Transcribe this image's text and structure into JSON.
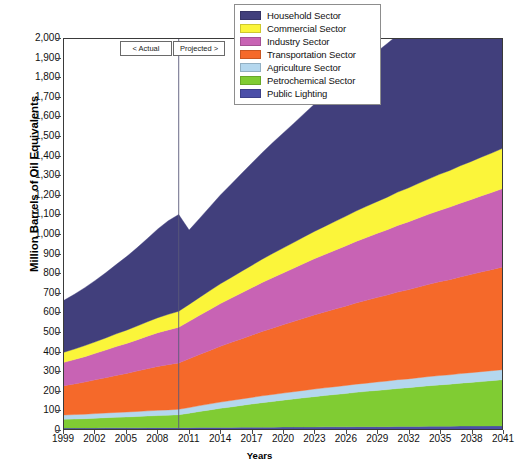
{
  "chart_data": {
    "type": "area",
    "stacked": true,
    "title": "",
    "xlabel": "Years",
    "ylabel": "Million Barrels of Oil Equivalents",
    "xlim": [
      1999,
      2041
    ],
    "ylim": [
      0,
      2000
    ],
    "ytick_step": 100,
    "xtick_step": 3,
    "grid": false,
    "legend_position": "top-right",
    "y_ticks": [
      "0",
      "100",
      "200",
      "300",
      "400",
      "500",
      "600",
      "700",
      "800",
      "900",
      "1,000",
      "1,100",
      "1,200",
      "1,300",
      "1,400",
      "1,500",
      "1,600",
      "1,700",
      "1,800",
      "1,900",
      "2,000"
    ],
    "x_ticks": [
      "1999",
      "2002",
      "2005",
      "2008",
      "2011",
      "2014",
      "2017",
      "2020",
      "2023",
      "2026",
      "2029",
      "2032",
      "2035",
      "2038",
      "2041"
    ],
    "x": [
      1999,
      2000,
      2001,
      2002,
      2003,
      2004,
      2005,
      2006,
      2007,
      2008,
      2009,
      2010,
      2011,
      2012,
      2013,
      2014,
      2015,
      2016,
      2017,
      2018,
      2019,
      2020,
      2021,
      2022,
      2023,
      2024,
      2025,
      2026,
      2027,
      2028,
      2029,
      2030,
      2031,
      2032,
      2033,
      2034,
      2035,
      2036,
      2037,
      2038,
      2039,
      2040,
      2041
    ],
    "annotations": [
      {
        "name": "actual-label",
        "text": "< Actual",
        "x": 2010
      },
      {
        "name": "projected-label",
        "text": "Projected >",
        "x": 2010
      },
      {
        "name": "divider-line",
        "x": 2010
      }
    ],
    "colors": {
      "household": "#413f7c",
      "commercial": "#fbf53a",
      "industry": "#c863b4",
      "transportation": "#f5692a",
      "agriculture": "#b4d7ee",
      "petrochemical": "#80cc33",
      "public_lighting": "#4b4fa8"
    },
    "series": [
      {
        "name": "Public Lighting",
        "key": "public_lighting",
        "color": "#4b4fa8",
        "values": [
          5,
          5,
          5,
          5,
          6,
          6,
          6,
          6,
          7,
          7,
          7,
          7,
          7,
          8,
          8,
          8,
          8,
          9,
          9,
          9,
          9,
          10,
          10,
          10,
          10,
          11,
          11,
          11,
          12,
          12,
          12,
          12,
          13,
          13,
          13,
          14,
          14,
          14,
          15,
          15,
          15,
          16,
          16
        ]
      },
      {
        "name": "Petrochemical Sector",
        "key": "petrochemical",
        "color": "#80cc33",
        "values": [
          45,
          46,
          48,
          50,
          52,
          54,
          56,
          58,
          60,
          62,
          64,
          66,
          74,
          82,
          90,
          98,
          105,
          112,
          119,
          126,
          132,
          138,
          144,
          150,
          156,
          161,
          166,
          171,
          176,
          181,
          186,
          190,
          195,
          199,
          204,
          208,
          212,
          216,
          220,
          224,
          228,
          232,
          236
        ]
      },
      {
        "name": "Agriculture Sector",
        "key": "agriculture",
        "color": "#b4d7ee",
        "values": [
          22,
          23,
          23,
          24,
          24,
          25,
          25,
          26,
          26,
          27,
          27,
          28,
          29,
          30,
          31,
          32,
          33,
          33,
          34,
          35,
          36,
          36,
          37,
          38,
          39,
          39,
          40,
          41,
          42,
          42,
          43,
          44,
          45,
          45,
          46,
          47,
          48,
          48,
          49,
          50,
          51,
          51,
          52
        ]
      },
      {
        "name": "Transportation Sector",
        "key": "transportation",
        "color": "#f5692a",
        "values": [
          150,
          157,
          165,
          173,
          181,
          190,
          198,
          207,
          216,
          225,
          232,
          238,
          250,
          262,
          274,
          286,
          297,
          308,
          319,
          330,
          340,
          350,
          360,
          370,
          380,
          389,
          398,
          407,
          416,
          425,
          433,
          441,
          449,
          457,
          465,
          473,
          481,
          488,
          496,
          503,
          511,
          518,
          526
        ]
      },
      {
        "name": "Industry Sector",
        "key": "industry",
        "color": "#c863b4",
        "values": [
          120,
          125,
          130,
          136,
          142,
          148,
          154,
          160,
          167,
          173,
          178,
          183,
          192,
          201,
          210,
          219,
          227,
          235,
          243,
          251,
          259,
          266,
          273,
          281,
          288,
          295,
          302,
          309,
          316,
          322,
          329,
          335,
          342,
          348,
          354,
          360,
          366,
          372,
          378,
          384,
          390,
          396,
          402
        ]
      },
      {
        "name": "Commercial Sector",
        "key": "commercial",
        "color": "#fbf53a",
        "values": [
          52,
          54,
          57,
          59,
          62,
          65,
          68,
          71,
          74,
          77,
          80,
          82,
          87,
          92,
          97,
          102,
          106,
          111,
          115,
          120,
          124,
          128,
          132,
          136,
          140,
          144,
          148,
          152,
          156,
          160,
          163,
          167,
          171,
          174,
          178,
          181,
          185,
          188,
          192,
          195,
          199,
          202,
          206
        ]
      },
      {
        "name": "Household Sector",
        "key": "household",
        "color": "#413f7c",
        "values": [
          266,
          281,
          297,
          315,
          334,
          355,
          377,
          401,
          427,
          455,
          480,
          496,
          381,
          405,
          430,
          455,
          478,
          501,
          524,
          546,
          568,
          589,
          610,
          631,
          652,
          672,
          692,
          712,
          731,
          750,
          769,
          788,
          806,
          824,
          842,
          860,
          877,
          895,
          912,
          929,
          946,
          962,
          979
        ]
      }
    ],
    "totals_note": {
      "start_total": 660,
      "peak_actual_total": 1216,
      "post_break_total": 820,
      "end_total": 2000
    }
  },
  "legend": {
    "items": [
      {
        "label": "Household Sector",
        "color_key": "household"
      },
      {
        "label": "Commercial Sector",
        "color_key": "commercial"
      },
      {
        "label": "Industry Sector",
        "color_key": "industry"
      },
      {
        "label": "Transportation Sector",
        "color_key": "transportation"
      },
      {
        "label": "Agriculture Sector",
        "color_key": "agriculture"
      },
      {
        "label": "Petrochemical Sector",
        "color_key": "petrochemical"
      },
      {
        "label": "Public Lighting",
        "color_key": "public_lighting"
      }
    ]
  }
}
